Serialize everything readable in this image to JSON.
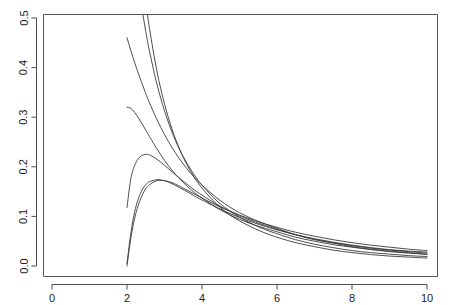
{
  "chart_data": {
    "type": "line",
    "title": "",
    "subtitle": "",
    "xlabel": "",
    "ylabel": "",
    "xlim": [
      0,
      10
    ],
    "ylim": [
      0.0,
      0.5
    ],
    "grid": false,
    "legend": false,
    "legend_position": "none",
    "xticks": [
      0,
      2,
      4,
      6,
      8,
      10
    ],
    "xtick_labels": [
      "0",
      "2",
      "4",
      "6",
      "8",
      "10"
    ],
    "yticks": [
      0.0,
      0.1,
      0.2,
      0.3,
      0.4,
      0.5
    ],
    "ytick_labels": [
      "0.0",
      "0.1",
      "0.2",
      "0.3",
      "0.4",
      "0.5"
    ],
    "x_domain_start": 2,
    "x_domain_end": 10,
    "crossing_point": {
      "x": 4.0,
      "y": 0.14
    },
    "annotations": [],
    "series": [
      {
        "name": "curve-1",
        "x": [
          2.0,
          2.1,
          2.2,
          2.3,
          2.4,
          2.5,
          2.6,
          2.8,
          3.0,
          3.2,
          3.4,
          3.6,
          3.8,
          4.0,
          4.4,
          4.8,
          5.2,
          5.6,
          6.0,
          6.5,
          7.0,
          7.5,
          8.0,
          8.5,
          9.0,
          9.5,
          10.0
        ],
        "values": [
          0.0,
          0.055,
          0.095,
          0.122,
          0.142,
          0.156,
          0.164,
          0.172,
          0.172,
          0.168,
          0.161,
          0.153,
          0.145,
          0.137,
          0.122,
          0.109,
          0.097,
          0.087,
          0.078,
          0.068,
          0.06,
          0.053,
          0.047,
          0.042,
          0.038,
          0.034,
          0.031
        ]
      },
      {
        "name": "curve-2",
        "x": [
          2.0,
          2.1,
          2.2,
          2.3,
          2.4,
          2.5,
          2.6,
          2.8,
          3.0,
          3.2,
          3.4,
          3.6,
          3.8,
          4.0,
          4.4,
          4.8,
          5.2,
          5.6,
          6.0,
          6.5,
          7.0,
          7.5,
          8.0,
          8.5,
          9.0,
          9.5,
          10.0
        ],
        "values": [
          0.005,
          0.065,
          0.108,
          0.135,
          0.153,
          0.164,
          0.17,
          0.174,
          0.172,
          0.166,
          0.158,
          0.15,
          0.141,
          0.133,
          0.118,
          0.104,
          0.092,
          0.082,
          0.073,
          0.063,
          0.055,
          0.048,
          0.042,
          0.037,
          0.033,
          0.03,
          0.028
        ]
      },
      {
        "name": "curve-3",
        "x": [
          2.0,
          2.1,
          2.2,
          2.3,
          2.4,
          2.5,
          2.6,
          2.8,
          3.0,
          3.2,
          3.4,
          3.6,
          3.8,
          4.0,
          4.4,
          4.8,
          5.2,
          5.6,
          6.0,
          6.5,
          7.0,
          7.5,
          8.0,
          8.5,
          9.0,
          9.5,
          10.0
        ],
        "values": [
          0.118,
          0.175,
          0.202,
          0.216,
          0.223,
          0.225,
          0.224,
          0.215,
          0.203,
          0.19,
          0.177,
          0.165,
          0.153,
          0.143,
          0.124,
          0.108,
          0.095,
          0.084,
          0.074,
          0.063,
          0.054,
          0.047,
          0.041,
          0.036,
          0.032,
          0.029,
          0.026
        ]
      },
      {
        "name": "curve-4",
        "x": [
          2.0,
          2.1,
          2.2,
          2.3,
          2.4,
          2.5,
          2.6,
          2.8,
          3.0,
          3.2,
          3.4,
          3.6,
          3.8,
          4.0,
          4.4,
          4.8,
          5.2,
          5.6,
          6.0,
          6.5,
          7.0,
          7.5,
          8.0,
          8.5,
          9.0,
          9.5,
          10.0
        ],
        "values": [
          0.32,
          0.318,
          0.31,
          0.299,
          0.287,
          0.274,
          0.261,
          0.236,
          0.213,
          0.193,
          0.176,
          0.161,
          0.148,
          0.137,
          0.117,
          0.101,
          0.088,
          0.078,
          0.069,
          0.058,
          0.05,
          0.043,
          0.038,
          0.033,
          0.029,
          0.026,
          0.024
        ]
      },
      {
        "name": "curve-5",
        "x": [
          2.0,
          2.1,
          2.2,
          2.3,
          2.4,
          2.5,
          2.6,
          2.8,
          3.0,
          3.2,
          3.4,
          3.6,
          3.8,
          4.0,
          4.4,
          4.8,
          5.2,
          5.6,
          6.0,
          6.5,
          7.0,
          7.5,
          8.0,
          8.5,
          9.0,
          9.5,
          10.0
        ],
        "values": [
          0.46,
          0.435,
          0.411,
          0.389,
          0.368,
          0.348,
          0.329,
          0.295,
          0.265,
          0.239,
          0.216,
          0.196,
          0.178,
          0.163,
          0.137,
          0.116,
          0.1,
          0.087,
          0.076,
          0.063,
          0.053,
          0.046,
          0.039,
          0.034,
          0.03,
          0.027,
          0.023
        ]
      },
      {
        "name": "curve-6",
        "x": [
          2.0,
          2.1,
          2.2,
          2.3,
          2.4,
          2.5,
          2.6,
          2.8,
          3.0,
          3.2,
          3.4,
          3.6,
          3.8,
          4.0,
          4.4,
          4.8,
          5.2,
          5.6,
          6.0,
          6.5,
          7.0,
          7.5,
          8.0,
          8.5,
          9.0,
          9.5,
          10.0
        ],
        "values": [
          0.78,
          0.7,
          0.631,
          0.571,
          0.519,
          0.473,
          0.433,
          0.366,
          0.313,
          0.27,
          0.235,
          0.207,
          0.183,
          0.163,
          0.131,
          0.108,
          0.09,
          0.076,
          0.065,
          0.053,
          0.044,
          0.037,
          0.031,
          0.027,
          0.024,
          0.021,
          0.019
        ]
      },
      {
        "name": "curve-7",
        "x": [
          2.0,
          2.1,
          2.2,
          2.3,
          2.4,
          2.5,
          2.6,
          2.8,
          3.0,
          3.2,
          3.4,
          3.6,
          3.8,
          4.0,
          4.4,
          4.8,
          5.2,
          5.6,
          6.0,
          6.5,
          7.0,
          7.5,
          8.0,
          8.5,
          9.0,
          9.5,
          10.0
        ],
        "values": [
          1.0,
          0.87,
          0.762,
          0.672,
          0.597,
          0.533,
          0.479,
          0.392,
          0.327,
          0.276,
          0.236,
          0.204,
          0.178,
          0.157,
          0.124,
          0.1,
          0.083,
          0.069,
          0.058,
          0.047,
          0.039,
          0.032,
          0.027,
          0.023,
          0.02,
          0.018,
          0.016
        ]
      }
    ]
  },
  "style": {
    "line_color": "#3a3a3a",
    "axis_color": "#555555",
    "text_color": "#1a1a1a",
    "background": "#ffffff"
  }
}
